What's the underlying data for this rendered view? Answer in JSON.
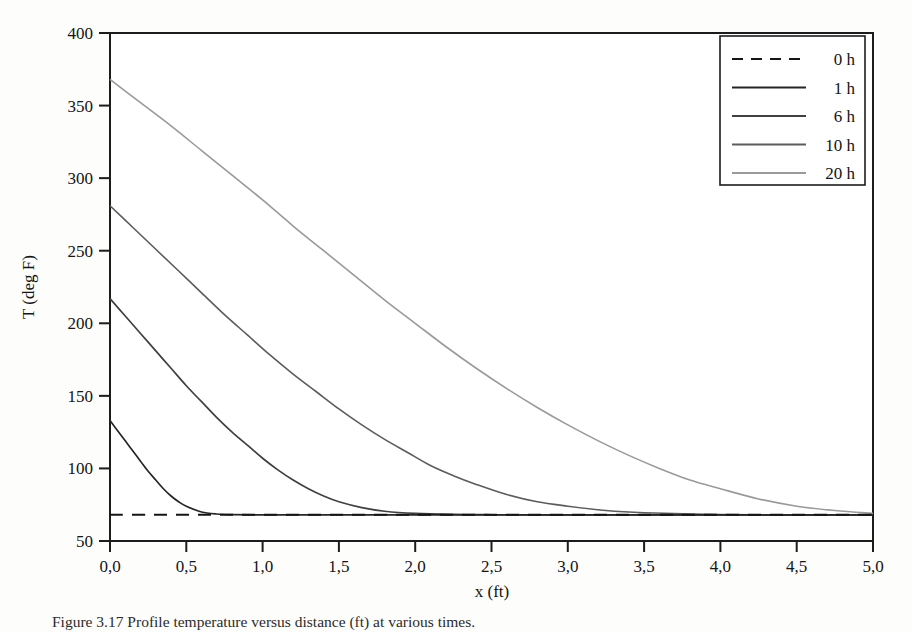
{
  "figure": {
    "caption": "Figure 3.17 Profile temperature versus distance (ft) at various times."
  },
  "chart_data": {
    "type": "line",
    "title": "",
    "xlabel": "x (ft)",
    "ylabel": "T (deg F)",
    "xlim": [
      0,
      5
    ],
    "ylim": [
      50,
      400
    ],
    "xticks": [
      0,
      0.5,
      1,
      1.5,
      2,
      2.5,
      3,
      3.5,
      4,
      4.5,
      5
    ],
    "xticklabels": [
      "0,0",
      "0,5",
      "1,0",
      "1,5",
      "2,0",
      "2,5",
      "3,0",
      "3,5",
      "4,0",
      "4,5",
      "5,0"
    ],
    "yticks": [
      50,
      100,
      150,
      200,
      250,
      300,
      350,
      400
    ],
    "yticklabels": [
      "50",
      "100",
      "150",
      "200",
      "250",
      "300",
      "350",
      "400"
    ],
    "grid": false,
    "decimal_separator": "comma",
    "legend_position": "upper right",
    "ambient_temperature": 68,
    "series": [
      {
        "name": "0 h",
        "style": "dashed",
        "color": "#151515",
        "width": 2.0,
        "x": [
          0.0,
          0.25,
          0.5,
          0.75,
          1.0,
          1.25,
          1.5,
          1.75,
          2.0,
          2.5,
          3.0,
          3.5,
          4.0,
          4.5,
          5.0
        ],
        "y": [
          68,
          68,
          68,
          68,
          68,
          68,
          68,
          68,
          68,
          68,
          68,
          68,
          68,
          68,
          68
        ]
      },
      {
        "name": "1 h",
        "style": "solid",
        "color": "#262626",
        "width": 1.7,
        "x": [
          0.0,
          0.05,
          0.1,
          0.15,
          0.2,
          0.25,
          0.3,
          0.35,
          0.4,
          0.45,
          0.5,
          0.6,
          0.7,
          0.8,
          1.0,
          1.25,
          1.5,
          2.0,
          2.5,
          3.0,
          3.5,
          4.0,
          4.5,
          5.0
        ],
        "y": [
          133,
          126,
          119,
          112,
          105,
          98,
          92,
          86,
          81,
          77,
          74,
          70,
          68.6,
          68.2,
          68,
          68,
          68,
          68,
          68,
          68,
          68,
          68,
          68,
          68
        ]
      },
      {
        "name": "6 h",
        "style": "solid",
        "color": "#404040",
        "width": 1.7,
        "x": [
          0.0,
          0.1,
          0.2,
          0.3,
          0.4,
          0.5,
          0.6,
          0.7,
          0.8,
          0.9,
          1.0,
          1.1,
          1.2,
          1.3,
          1.4,
          1.5,
          1.65,
          1.8,
          2.0,
          2.25,
          2.5,
          3.0,
          3.5,
          4.0,
          4.5,
          5.0
        ],
        "y": [
          217,
          205,
          193,
          181,
          169,
          157,
          146,
          135,
          125,
          116,
          107,
          99,
          92,
          86,
          81,
          77,
          73,
          70.5,
          69,
          68.3,
          68.1,
          68,
          68,
          68,
          68,
          68
        ]
      },
      {
        "name": "10 h",
        "style": "solid",
        "color": "#5c5c5c",
        "width": 1.6,
        "x": [
          0.0,
          0.15,
          0.3,
          0.45,
          0.6,
          0.75,
          0.9,
          1.05,
          1.2,
          1.35,
          1.5,
          1.65,
          1.8,
          1.95,
          2.1,
          2.25,
          2.4,
          2.6,
          2.8,
          3.0,
          3.25,
          3.5,
          4.0,
          4.5,
          5.0
        ],
        "y": [
          281,
          266,
          251,
          236,
          221,
          206,
          192,
          178,
          165,
          153,
          141,
          130,
          120,
          111,
          102,
          95,
          89,
          82,
          77,
          74,
          71,
          69.5,
          68.3,
          68,
          68
        ]
      },
      {
        "name": "20 h",
        "style": "solid",
        "color": "#9a9a9a",
        "width": 1.6,
        "x": [
          0.0,
          0.2,
          0.4,
          0.6,
          0.8,
          1.0,
          1.2,
          1.4,
          1.6,
          1.8,
          2.0,
          2.2,
          2.4,
          2.6,
          2.8,
          3.0,
          3.2,
          3.4,
          3.6,
          3.8,
          4.0,
          4.25,
          4.5,
          4.75,
          5.0
        ],
        "y": [
          368,
          352,
          336,
          319,
          302,
          285,
          267,
          250,
          233,
          216,
          200,
          184,
          169,
          155,
          142,
          130,
          119,
          109,
          100,
          92,
          86,
          79,
          74,
          71,
          69
        ]
      }
    ]
  },
  "legend": {
    "entries": [
      {
        "label": "0 h"
      },
      {
        "label": "1 h"
      },
      {
        "label": "6 h"
      },
      {
        "label": "10 h"
      },
      {
        "label": "20 h"
      }
    ]
  }
}
